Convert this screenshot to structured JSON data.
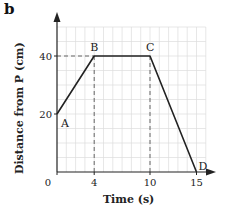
{
  "panel_label": "b",
  "chart_data": {
    "type": "line",
    "title": "",
    "xlabel": "Time (s)",
    "ylabel": "Distance from P (cm)",
    "x": [
      0,
      4,
      10,
      15
    ],
    "series": [
      {
        "name": "distance",
        "values": [
          20,
          40,
          40,
          0
        ]
      }
    ],
    "points": [
      {
        "label": "A",
        "x": 0,
        "y": 20
      },
      {
        "label": "B",
        "x": 4,
        "y": 40
      },
      {
        "label": "C",
        "x": 10,
        "y": 40
      },
      {
        "label": "D",
        "x": 15,
        "y": 0
      }
    ],
    "xticks": [
      "0",
      "4",
      "10",
      "15"
    ],
    "yticks": [
      "20",
      "40"
    ],
    "xlim": [
      0,
      16
    ],
    "ylim": [
      0,
      50
    ],
    "grid": true,
    "legend": null,
    "guides": [
      {
        "type": "horizontal-dashed",
        "y": 40,
        "from_x": 0,
        "to_x": 4
      },
      {
        "type": "vertical-dashed",
        "x": 4,
        "from_y": 0,
        "to_y": 40
      },
      {
        "type": "vertical-dashed",
        "x": 10,
        "from_y": 0,
        "to_y": 40
      }
    ]
  },
  "colors": {
    "line": "#222222",
    "grid": "#dcdcdc",
    "axis": "#222222",
    "dash": "#666666"
  }
}
